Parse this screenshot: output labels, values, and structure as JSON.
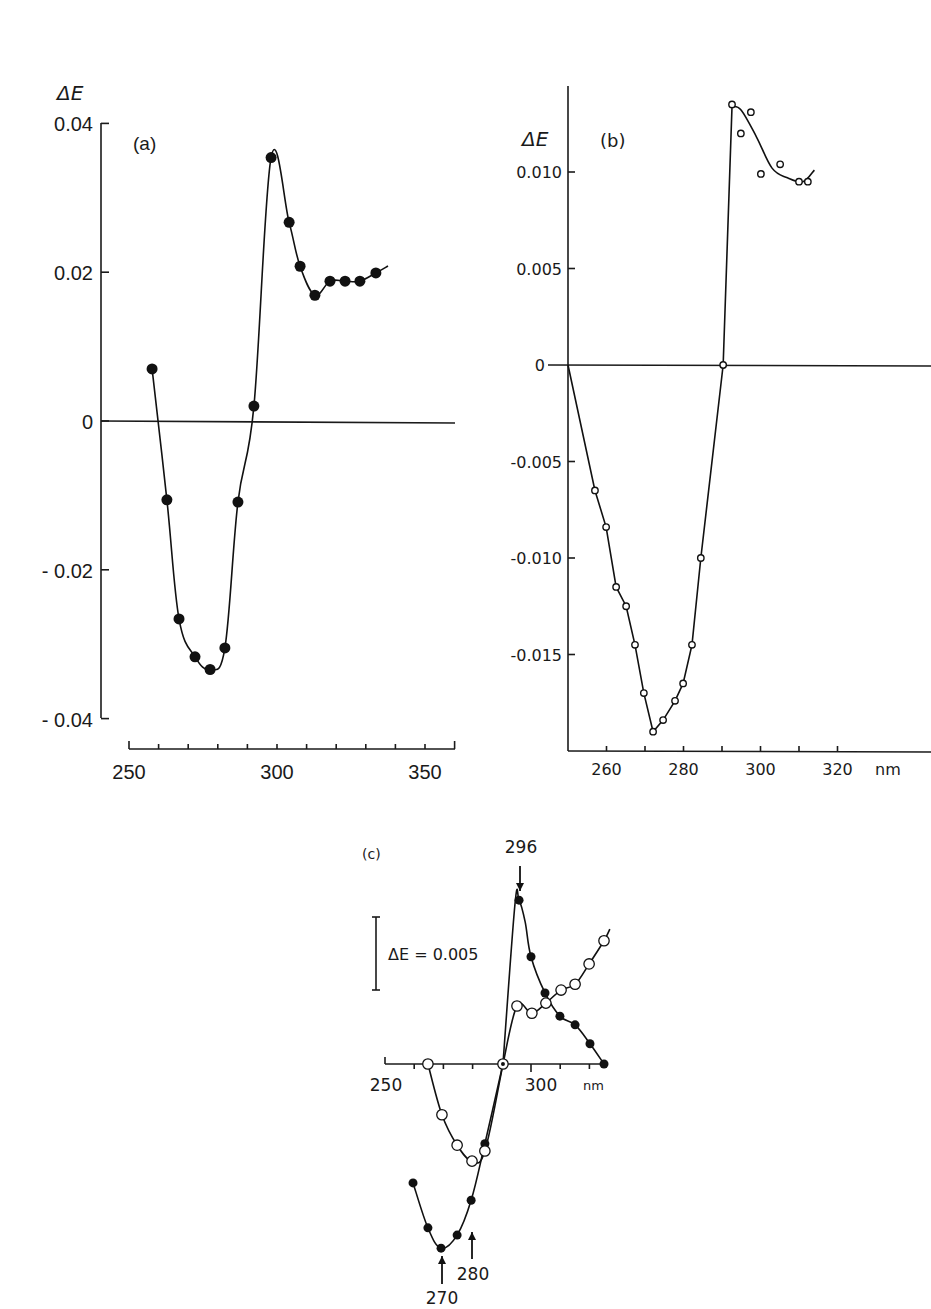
{
  "chart_data": [
    {
      "id": "a",
      "type": "line",
      "panel_label": "(a)",
      "ylabel": "ΔE",
      "xlabel": "",
      "xlim": [
        250,
        360
      ],
      "ylim": [
        -0.04,
        0.04
      ],
      "xticks": [
        250,
        300,
        350
      ],
      "xtick_labels": [
        "250",
        "300",
        "350"
      ],
      "yticks": [
        0.04,
        0.02,
        0,
        -0.02,
        -0.04
      ],
      "ytick_labels": [
        "0.04",
        "0.02",
        "0",
        "- 0.02",
        "- 0.04"
      ],
      "zero_line": true,
      "series": [
        {
          "name": "filled circles",
          "marker": "filled",
          "x": [
            257.8,
            262.8,
            266.9,
            272.3,
            277.4,
            282.4,
            286.8,
            292.2,
            298.0,
            304.1,
            307.8,
            312.8,
            317.9,
            323.0,
            328.0,
            333.4
          ],
          "y": [
            0.007,
            -0.0106,
            -0.0266,
            -0.0317,
            -0.0334,
            -0.0305,
            -0.0109,
            0.002,
            0.0354,
            0.0267,
            0.0208,
            0.0169,
            0.0188,
            0.0188,
            0.0188,
            0.0199
          ]
        }
      ]
    },
    {
      "id": "b",
      "type": "line",
      "panel_label": "(b)",
      "ylabel": "ΔE",
      "xlabel": "nm",
      "xlim": [
        250,
        340
      ],
      "ylim": [
        -0.02,
        0.014
      ],
      "xticks": [
        260,
        270,
        280,
        290,
        300,
        310,
        320
      ],
      "xtick_labels": [
        "260",
        "",
        "280",
        "",
        "300",
        "",
        "320"
      ],
      "yticks": [
        0.01,
        0.005,
        0,
        -0.005,
        -0.01,
        -0.015
      ],
      "ytick_labels": [
        "0.010",
        "0.005",
        "0",
        "-0.005",
        "-0.010",
        "-0.015"
      ],
      "zero_line": true,
      "series": [
        {
          "name": "open circles",
          "marker": "open",
          "x": [
            250.0,
            257.0,
            259.9,
            262.5,
            265.1,
            267.4,
            269.7,
            272.1,
            274.7,
            277.8,
            279.9,
            282.2,
            284.5,
            290.3,
            292.6,
            294.9,
            297.5,
            300.1,
            305.1,
            310.0,
            312.3
          ],
          "y": [
            0.0,
            -0.0065,
            -0.0084,
            -0.0115,
            -0.0125,
            -0.0145,
            -0.017,
            -0.019,
            -0.0184,
            -0.0174,
            -0.0165,
            -0.0145,
            -0.01,
            0.0,
            0.0135,
            0.012,
            0.0131,
            0.0099,
            0.0104,
            0.0095,
            0.0095
          ]
        }
      ]
    },
    {
      "id": "c",
      "type": "line",
      "panel_label": "(c)",
      "ylabel": "",
      "xlabel": "nm",
      "xlim": [
        250,
        325
      ],
      "xticks": [
        250,
        260,
        270,
        280,
        290,
        300,
        310,
        320
      ],
      "xtick_labels": [
        "250",
        "",
        "",
        "",
        "",
        "300",
        "",
        ""
      ],
      "scale_bar_label": "ΔE = 0.005",
      "scale_bar_value": 0.005,
      "annotations": [
        {
          "text": "296",
          "x": 296,
          "direction": "down"
        },
        {
          "text": "270",
          "x": 270,
          "direction": "up"
        },
        {
          "text": "280",
          "x": 280,
          "direction": "up"
        }
      ],
      "series": [
        {
          "name": "filled circles",
          "marker": "filled",
          "x": [
            259.6,
            264.7,
            269.2,
            274.7,
            279.5,
            284.2,
            290.4,
            295.9,
            300.0,
            304.8,
            309.9,
            315.1,
            320.2,
            325.0
          ],
          "y": [
            -0.0082,
            -0.0113,
            -0.0127,
            -0.0118,
            -0.0094,
            -0.0055,
            0.0,
            0.0113,
            0.0074,
            0.0049,
            0.0033,
            0.0027,
            0.0014,
            0.0
          ]
        },
        {
          "name": "open circles",
          "marker": "open",
          "x": [
            264.7,
            269.5,
            274.7,
            279.8,
            284.2,
            290.4,
            295.2,
            300.3,
            305.1,
            310.3,
            315.1,
            319.9,
            325.0
          ],
          "y": [
            0.0,
            -0.0035,
            -0.0056,
            -0.0067,
            -0.006,
            0.0,
            0.004,
            0.0035,
            0.0042,
            0.0051,
            0.0055,
            0.0069,
            0.0085
          ]
        }
      ]
    }
  ],
  "labels": {
    "a_panel": "(a)",
    "a_ylabel": "ΔE",
    "b_panel": "(b)",
    "b_ylabel": "ΔE",
    "b_xunit": "nm",
    "c_panel": "(c)",
    "c_scale": "ΔE = 0.005",
    "c_xunit": "nm",
    "c_peak": "296",
    "c_min1": "270",
    "c_min2": "280"
  },
  "colors": {
    "ink": "#1a1a1a",
    "background": "#ffffff"
  }
}
